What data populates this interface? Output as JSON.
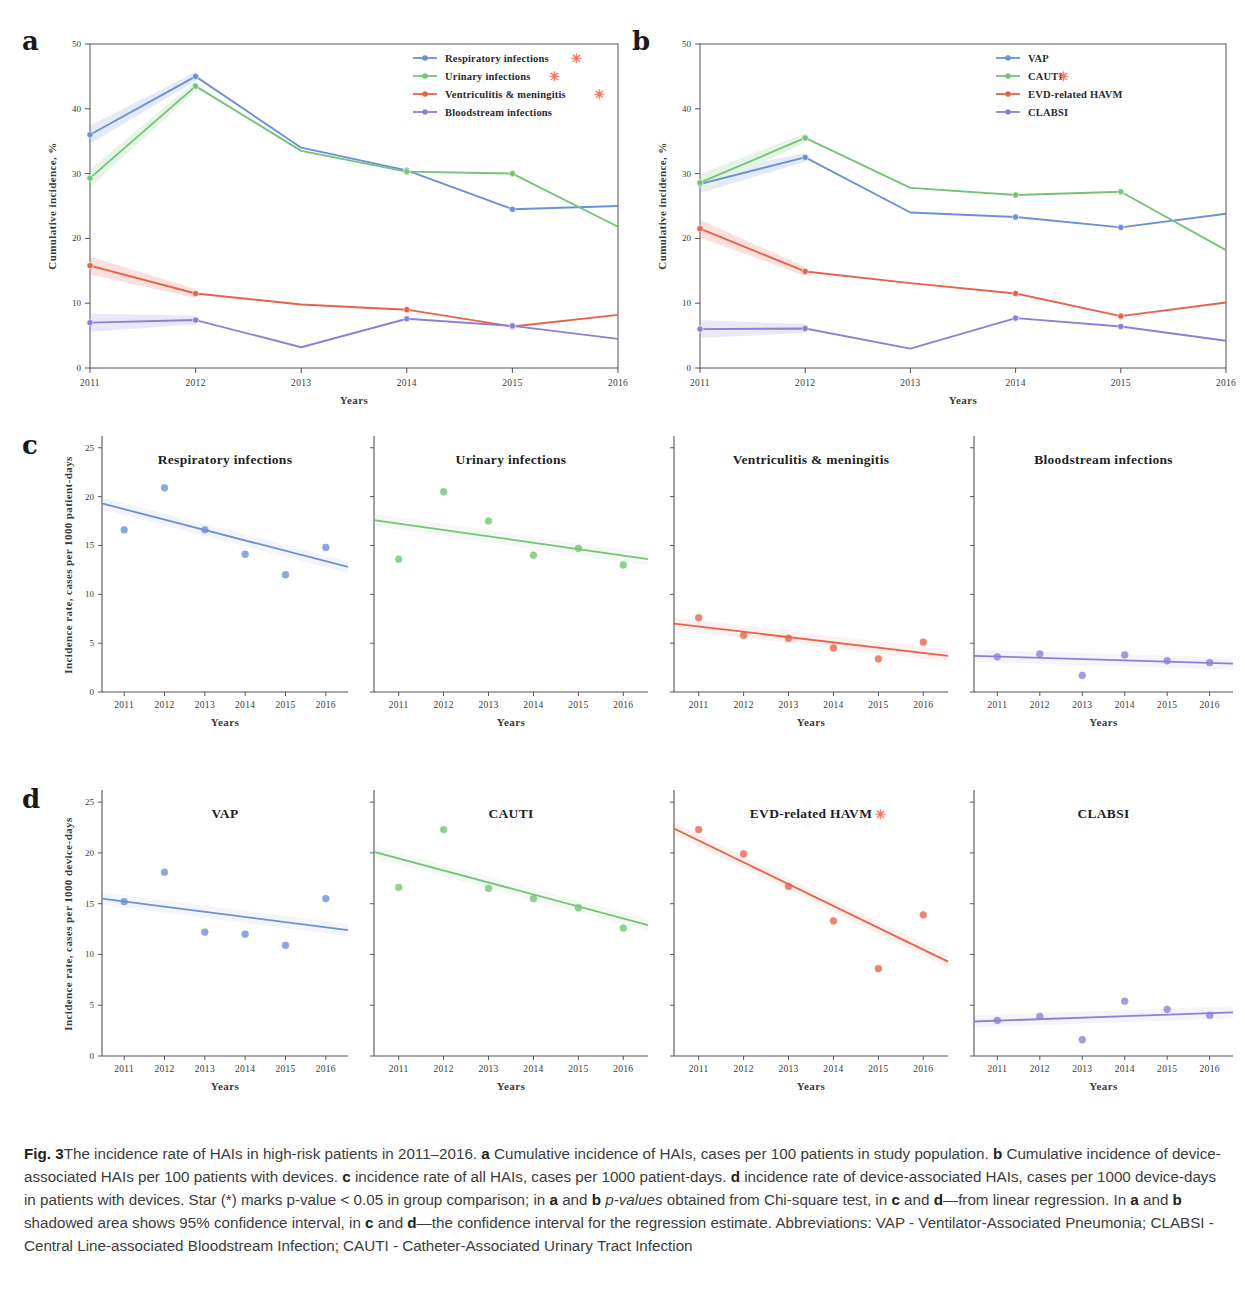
{
  "figure": {
    "label": "Fig. 3",
    "caption_parts": {
      "t1": "The incidence rate of HAIs in high-risk patients in 2011–2016. ",
      "a": "a",
      "t2": " Cumulative incidence of HAIs, cases per 100 patients in study population. ",
      "b": "b",
      "t3": " Cumulative incidence of device-associated HAIs per 100 patients with devices. ",
      "c": "c",
      "t4": " incidence rate of all HAIs, cases per 1000 patient-days. ",
      "d": "d",
      "t5": " incidence rate of device-associated HAIs, cases per 1000 device-days in patients with devices. Star (*) marks p-value < 0.05 in group comparison; in ",
      "a2": "a",
      "t6": " and ",
      "b2": "b",
      "t7": " ",
      "pv": "p-values",
      "t8": " obtained from Chi-square test, in ",
      "c2": "c",
      "t9": " and ",
      "d2": "d",
      "t10": "—from linear regression. In ",
      "a3": "a",
      "t11": " and ",
      "b3": "b",
      "t12": " shadowed area shows 95% confidence interval, in ",
      "c3": "c",
      "t13": " and ",
      "d3": "d",
      "t14": "—the confidence interval for the regression estimate. Abbreviations: VAP - Ventilator-Associated Pneumonia; CLABSI - Central Line-associated Bloodstream Infection; CAUTI - Catheter-Associated Urinary Tract Infection"
    }
  },
  "panel_letters": {
    "a": "a",
    "b": "b",
    "c": "c",
    "d": "d"
  },
  "colors": {
    "blue": "#6d8fd6",
    "green": "#73c476",
    "red": "#e8614a",
    "purple": "#8e7fd6",
    "star": "#f4745c",
    "axis": "#4a4a4a"
  },
  "chart_data": [
    {
      "id": "panel-a",
      "type": "line",
      "title": "",
      "xlabel": "Years",
      "ylabel": "Cumulative incidence, %",
      "categories": [
        "2011",
        "2012",
        "2013",
        "2014",
        "2015",
        "2016"
      ],
      "xticklabels": [
        "2011",
        "2012",
        "2013",
        "2014",
        "2015",
        "2016"
      ],
      "yticks": [
        0,
        10,
        20,
        30,
        40,
        50
      ],
      "yticklabels": [
        "0",
        "10",
        "20",
        "30",
        "40",
        "50"
      ],
      "ylim": [
        0,
        50
      ],
      "grid": false,
      "legend_position": "top-right",
      "series": [
        {
          "name": "Respiratory infections",
          "star": true,
          "color": "#6d8fd6",
          "values": [
            36.0,
            45.0,
            34.0,
            30.5,
            24.5,
            25.0
          ]
        },
        {
          "name": "Urinary infections",
          "star": true,
          "color": "#73c476",
          "values": [
            29.3,
            43.5,
            33.5,
            30.3,
            30.0,
            21.8
          ]
        },
        {
          "name": "Ventriculitis & meningitis",
          "star": true,
          "color": "#e8614a",
          "values": [
            15.8,
            11.5,
            9.8,
            9.0,
            6.4,
            8.2
          ]
        },
        {
          "name": "Bloodstream infections",
          "star": false,
          "color": "#8e7fd6",
          "values": [
            7.0,
            7.4,
            3.2,
            7.6,
            6.5,
            4.5
          ]
        }
      ]
    },
    {
      "id": "panel-b",
      "type": "line",
      "title": "",
      "xlabel": "Years",
      "ylabel": "Cumulative incidence, %",
      "categories": [
        "2011",
        "2012",
        "2013",
        "2014",
        "2015",
        "2016"
      ],
      "xticklabels": [
        "2011",
        "2012",
        "2013",
        "2014",
        "2015",
        "2016"
      ],
      "yticks": [
        0,
        10,
        20,
        30,
        40,
        50
      ],
      "yticklabels": [
        "0",
        "10",
        "20",
        "30",
        "40",
        "50"
      ],
      "ylim": [
        0,
        50
      ],
      "grid": false,
      "legend_position": "top-right",
      "series": [
        {
          "name": "VAP",
          "star": false,
          "color": "#6d8fd6",
          "values": [
            28.4,
            32.5,
            24.0,
            23.3,
            21.7,
            23.8
          ]
        },
        {
          "name": "CAUTI",
          "star": true,
          "color": "#73c476",
          "values": [
            28.6,
            35.5,
            27.8,
            26.7,
            27.2,
            18.2
          ]
        },
        {
          "name": "EVD-related HAVM",
          "star": false,
          "color": "#e8614a",
          "values": [
            21.5,
            14.9,
            13.1,
            11.5,
            8.0,
            10.1
          ]
        },
        {
          "name": "CLABSI",
          "star": false,
          "color": "#8e7fd6",
          "values": [
            6.0,
            6.1,
            3.0,
            7.7,
            6.4,
            4.2
          ]
        }
      ]
    },
    {
      "id": "panel-c-1",
      "type": "scatter",
      "title": "Respiratory infections",
      "title_star": false,
      "xlabel": "Years",
      "ylabel": "Incidence rate, cases per 1000 patient-days",
      "x": [
        2011,
        2012,
        2013,
        2014,
        2015,
        2016
      ],
      "xticklabels": [
        "2011",
        "2012",
        "2013",
        "2014",
        "2015",
        "2016"
      ],
      "yticks": [
        0,
        5,
        10,
        15,
        20,
        25
      ],
      "yticklabels": [
        "0",
        "5",
        "10",
        "15",
        "20",
        "25"
      ],
      "ylim": [
        0,
        26
      ],
      "values": [
        16.6,
        20.9,
        16.6,
        14.1,
        12.0,
        14.8
      ],
      "color": "#6d8fd6",
      "regression": {
        "y_start": 19.3,
        "y_end": 12.8
      }
    },
    {
      "id": "panel-c-2",
      "type": "scatter",
      "title": "Urinary infections",
      "title_star": false,
      "xlabel": "Years",
      "ylabel": "",
      "x": [
        2011,
        2012,
        2013,
        2014,
        2015,
        2016
      ],
      "xticklabels": [
        "2011",
        "2012",
        "2013",
        "2014",
        "2015",
        "2016"
      ],
      "yticks": [
        0,
        5,
        10,
        15,
        20,
        25
      ],
      "yticklabels": [],
      "ylim": [
        0,
        26
      ],
      "values": [
        13.6,
        20.5,
        17.5,
        14.0,
        14.7,
        13.0
      ],
      "color": "#73c476",
      "regression": {
        "y_start": 17.6,
        "y_end": 13.6
      }
    },
    {
      "id": "panel-c-3",
      "type": "scatter",
      "title": "Ventriculitis & meningitis",
      "title_star": false,
      "xlabel": "Years",
      "ylabel": "",
      "x": [
        2011,
        2012,
        2013,
        2014,
        2015,
        2016
      ],
      "xticklabels": [
        "2011",
        "2012",
        "2013",
        "2014",
        "2015",
        "2016"
      ],
      "yticks": [
        0,
        5,
        10,
        15,
        20,
        25
      ],
      "yticklabels": [],
      "ylim": [
        0,
        26
      ],
      "values": [
        7.6,
        5.8,
        5.5,
        4.5,
        3.4,
        5.1
      ],
      "color": "#e8614a",
      "regression": {
        "y_start": 7.0,
        "y_end": 3.7
      }
    },
    {
      "id": "panel-c-4",
      "type": "scatter",
      "title": "Bloodstream infections",
      "title_star": false,
      "xlabel": "Years",
      "ylabel": "",
      "x": [
        2011,
        2012,
        2013,
        2014,
        2015,
        2016
      ],
      "xticklabels": [
        "2011",
        "2012",
        "2013",
        "2014",
        "2015",
        "2016"
      ],
      "yticks": [
        0,
        5,
        10,
        15,
        20,
        25
      ],
      "yticklabels": [],
      "ylim": [
        0,
        26
      ],
      "values": [
        3.6,
        3.9,
        1.7,
        3.8,
        3.2,
        3.0
      ],
      "color": "#8e7fd6",
      "regression": {
        "y_start": 3.7,
        "y_end": 2.9
      }
    },
    {
      "id": "panel-d-1",
      "type": "scatter",
      "title": "VAP",
      "title_star": false,
      "xlabel": "Years",
      "ylabel": "Incidence rate, cases per 1000 device-days",
      "x": [
        2011,
        2012,
        2013,
        2014,
        2015,
        2016
      ],
      "xticklabels": [
        "2011",
        "2012",
        "2013",
        "2014",
        "2015",
        "2016"
      ],
      "yticks": [
        0,
        5,
        10,
        15,
        20,
        25
      ],
      "yticklabels": [
        "0",
        "5",
        "10",
        "15",
        "20",
        "25"
      ],
      "ylim": [
        0,
        26
      ],
      "values": [
        15.2,
        18.1,
        12.2,
        12.0,
        10.9,
        15.5
      ],
      "color": "#6d8fd6",
      "regression": {
        "y_start": 15.5,
        "y_end": 12.4
      }
    },
    {
      "id": "panel-d-2",
      "type": "scatter",
      "title": "CAUTI",
      "title_star": false,
      "xlabel": "Years",
      "ylabel": "",
      "x": [
        2011,
        2012,
        2013,
        2014,
        2015,
        2016
      ],
      "xticklabels": [
        "2011",
        "2012",
        "2013",
        "2014",
        "2015",
        "2016"
      ],
      "yticks": [
        0,
        5,
        10,
        15,
        20,
        25
      ],
      "yticklabels": [],
      "ylim": [
        0,
        26
      ],
      "values": [
        16.6,
        22.3,
        16.5,
        15.5,
        14.6,
        12.6
      ],
      "color": "#73c476",
      "regression": {
        "y_start": 20.1,
        "y_end": 12.9
      }
    },
    {
      "id": "panel-d-3",
      "type": "scatter",
      "title": "EVD-related HAVM",
      "title_star": true,
      "xlabel": "Years",
      "ylabel": "",
      "x": [
        2011,
        2012,
        2013,
        2014,
        2015,
        2016
      ],
      "xticklabels": [
        "2011",
        "2012",
        "2013",
        "2014",
        "2015",
        "2016"
      ],
      "yticks": [
        0,
        5,
        10,
        15,
        20,
        25
      ],
      "yticklabels": [],
      "ylim": [
        0,
        26
      ],
      "values": [
        22.3,
        19.9,
        16.7,
        13.3,
        8.6,
        13.9
      ],
      "color": "#e8614a",
      "regression": {
        "y_start": 22.4,
        "y_end": 9.3
      }
    },
    {
      "id": "panel-d-4",
      "type": "scatter",
      "title": "CLABSI",
      "title_star": false,
      "xlabel": "Years",
      "ylabel": "",
      "x": [
        2011,
        2012,
        2013,
        2014,
        2015,
        2016
      ],
      "xticklabels": [
        "2011",
        "2012",
        "2013",
        "2014",
        "2015",
        "2016"
      ],
      "yticks": [
        0,
        5,
        10,
        15,
        20,
        25
      ],
      "yticklabels": [],
      "ylim": [
        0,
        26
      ],
      "values": [
        3.5,
        3.9,
        1.6,
        5.4,
        4.6,
        4.0
      ],
      "color": "#8e7fd6",
      "regression": {
        "y_start": 3.4,
        "y_end": 4.3
      }
    }
  ]
}
